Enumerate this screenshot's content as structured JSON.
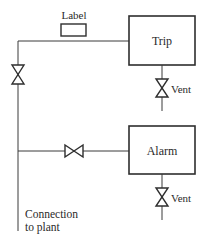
{
  "diagram": {
    "type": "piping-schematic",
    "label_tag": {
      "text": "Label"
    },
    "boxes": [
      {
        "id": "trip",
        "label": "Trip"
      },
      {
        "id": "alarm",
        "label": "Alarm"
      }
    ],
    "vents": [
      {
        "id": "trip-vent",
        "label": "Vent"
      },
      {
        "id": "alarm-vent",
        "label": "Vent"
      }
    ],
    "valves": [
      {
        "id": "isolation-valve-main",
        "orientation": "vertical"
      },
      {
        "id": "isolation-valve-alarm",
        "orientation": "horizontal"
      },
      {
        "id": "vent-valve-trip",
        "orientation": "vertical"
      },
      {
        "id": "vent-valve-alarm",
        "orientation": "vertical"
      }
    ],
    "connection": {
      "line1": "Connection",
      "line2": "to plant"
    }
  }
}
